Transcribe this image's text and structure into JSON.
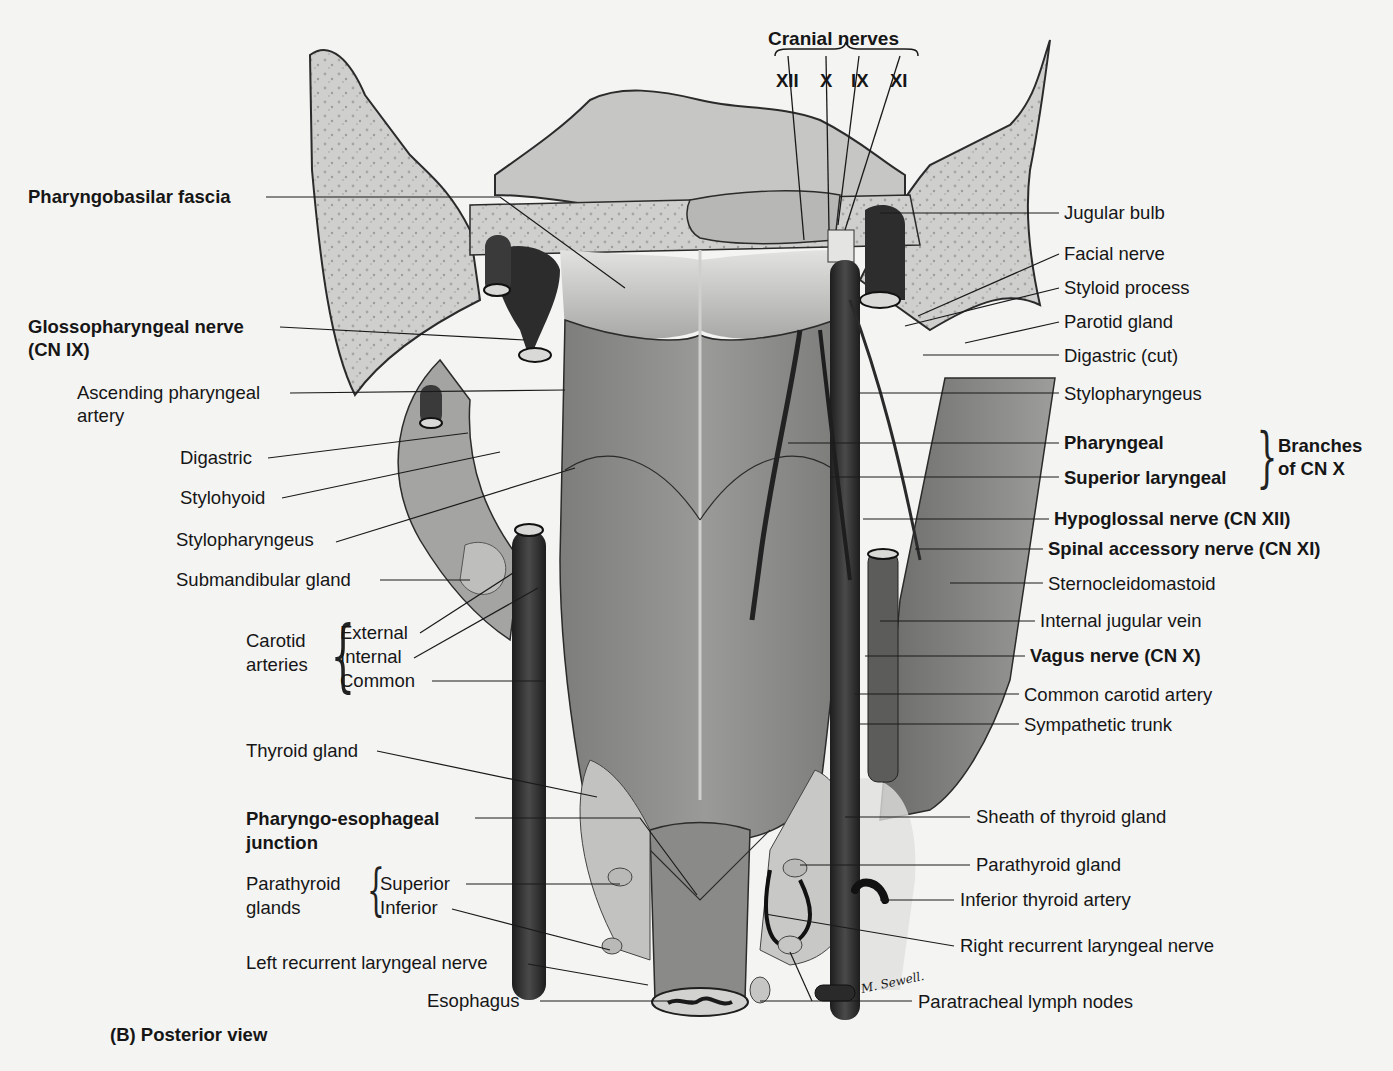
{
  "figure": {
    "caption": "(B) Posterior view",
    "signature": "M. Sewell.",
    "palette": {
      "background": "#f4f4f3",
      "bone": "#c9c9c7",
      "muscle": "#8d8d8b",
      "muscle_dark": "#6e6e6c",
      "vessel": "#2a2a2a",
      "fascia": "#d6d6d4",
      "gland": "#bdbdbb",
      "leader_line": "#1a1a1a"
    }
  },
  "cranial_nerves": {
    "title": "Cranial nerves",
    "numerals": [
      "XII",
      "X",
      "IX",
      "XI"
    ]
  },
  "left_labels": {
    "pharyngobasilar_fascia": "Pharyngobasilar fascia",
    "glossopharyngeal_nerve_1": "Glossopharyngeal nerve",
    "glossopharyngeal_nerve_2": "(CN IX)",
    "ascending_pharyngeal_1": "Ascending pharyngeal",
    "ascending_pharyngeal_2": "artery",
    "digastric": "Digastric",
    "stylohyoid": "Stylohyoid",
    "stylopharyngeus": "Stylopharyngeus",
    "submandibular_gland": "Submandibular gland",
    "carotid_group_1": "Carotid",
    "carotid_group_2": "arteries",
    "carotid_external": "External",
    "carotid_internal": "Internal",
    "carotid_common": "Common",
    "thyroid_gland": "Thyroid gland",
    "pharyngo_esophageal_1": "Pharyngo-esophageal",
    "pharyngo_esophageal_2": "junction",
    "parathyroid_group_1": "Parathyroid",
    "parathyroid_group_2": "glands",
    "parathyroid_superior": "Superior",
    "parathyroid_inferior": "Inferior",
    "left_recurrent_laryngeal": "Left recurrent laryngeal nerve",
    "esophagus": "Esophagus"
  },
  "right_labels": {
    "jugular_bulb": "Jugular bulb",
    "facial_nerve": "Facial nerve",
    "styloid_process": "Styloid process",
    "parotid_gland": "Parotid gland",
    "digastric_cut": "Digastric (cut)",
    "stylopharyngeus": "Stylopharyngeus",
    "pharyngeal": "Pharyngeal",
    "superior_laryngeal": "Superior laryngeal",
    "branches_group_1": "Branches",
    "branches_group_2": "of CN X",
    "hypoglossal_nerve": "Hypoglossal nerve (CN XII)",
    "spinal_accessory_nerve": "Spinal accessory nerve (CN XI)",
    "sternocleidomastoid": "Sternocleidomastoid",
    "internal_jugular_vein": "Internal jugular vein",
    "vagus_nerve": "Vagus nerve (CN X)",
    "common_carotid_artery": "Common carotid artery",
    "sympathetic_trunk": "Sympathetic trunk",
    "sheath_of_thyroid": "Sheath of thyroid gland",
    "parathyroid_gland": "Parathyroid gland",
    "inferior_thyroid_artery": "Inferior thyroid artery",
    "right_recurrent_laryngeal": "Right recurrent laryngeal nerve",
    "paratracheal_lymph_nodes": "Paratracheal lymph nodes"
  }
}
